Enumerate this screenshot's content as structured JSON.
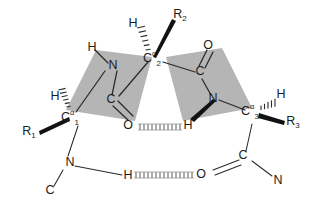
{
  "figure": {
    "type": "chemical-structure-diagram",
    "background_color": "#ffffff",
    "plane_fill_color": "#b5b5b5",
    "bond_color": "#2a2a2a",
    "hbond_color": "#6e6e6e"
  },
  "atoms": {
    "c1_alpha": {
      "element": "C",
      "superscript": "α",
      "subscript": "1"
    },
    "c2_alpha": {
      "element": "C",
      "superscript": "α",
      "subscript": "2"
    },
    "c3_alpha": {
      "element": "C",
      "superscript": "α",
      "subscript": "3"
    },
    "h_on_c1": {
      "label": "H"
    },
    "h_on_c2": {
      "label": "H"
    },
    "h_on_c3": {
      "label": "H"
    },
    "r1": {
      "element": "R",
      "subscript": "1"
    },
    "r2": {
      "element": "R",
      "subscript": "2"
    },
    "r3": {
      "element": "R",
      "subscript": "3"
    },
    "n_left_plane": {
      "label": "N"
    },
    "h_left_plane": {
      "label": "H"
    },
    "c_left_plane": {
      "label": "C"
    },
    "o_left_plane": {
      "label": "O"
    },
    "c_right_plane": {
      "label": "C"
    },
    "o_right_plane": {
      "label": "O"
    },
    "n_right_plane": {
      "label": "N"
    },
    "h_right_plane": {
      "label": "H"
    },
    "n_bottom_left": {
      "label": "N"
    },
    "c_bottom_left_terminus": {
      "label": "C"
    },
    "h_bottom_donor": {
      "label": "H"
    },
    "o_bottom_acceptor": {
      "label": "O"
    },
    "c_bottom_right": {
      "label": "C"
    },
    "n_bottom_right": {
      "label": "N"
    }
  },
  "hydrogen_bonds": [
    {
      "name": "upper-hydrogen-bond",
      "donor": "H",
      "acceptor": "O"
    },
    {
      "name": "lower-hydrogen-bond",
      "donor": "H",
      "acceptor": "O"
    }
  ],
  "planes": [
    {
      "name": "left-peptide-plane",
      "label": "peptide plane C1-N-C-C2"
    },
    {
      "name": "right-peptide-plane",
      "label": "peptide plane C2-C-N-C3"
    }
  ],
  "stereo_bonds": [
    {
      "name": "r1-wedge",
      "style": "solid-wedge"
    },
    {
      "name": "h1-hash",
      "style": "hashed-wedge"
    },
    {
      "name": "r2-wedge",
      "style": "solid-wedge"
    },
    {
      "name": "h2-hash",
      "style": "hashed-wedge"
    },
    {
      "name": "r3-wedge",
      "style": "solid-wedge"
    },
    {
      "name": "h3-hash",
      "style": "hashed-wedge"
    },
    {
      "name": "h-right-plane-wedge",
      "style": "solid-wedge"
    }
  ]
}
